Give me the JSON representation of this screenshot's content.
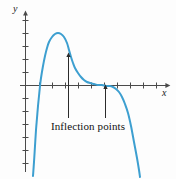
{
  "figure": {
    "background_color": "#fdfdfd",
    "width": 176,
    "height": 179
  },
  "axes": {
    "y_label": "y",
    "x_label": "x",
    "origin": {
      "x": 25,
      "y": 85
    },
    "axis_color": "#4a4a4a",
    "x_axis_from": 20,
    "x_axis_to": 168,
    "y_axis_from": 14,
    "y_axis_to": 172,
    "x_tick_positions": [
      39,
      52,
      65,
      78,
      91,
      104,
      117,
      130,
      143,
      156
    ],
    "y_tick_positions": [
      20,
      33,
      46,
      59,
      72,
      98,
      111,
      124,
      137,
      150,
      163
    ],
    "tick_half_length": 3
  },
  "annotations": {
    "label": "Inflection points",
    "label_color": "#111111",
    "arrow_color": "#2b2b2b",
    "arrows": [
      {
        "name": "left-inflection-arrow",
        "x": 68,
        "tip_y": 56,
        "tail_y": 118
      },
      {
        "name": "right-inflection-arrow",
        "x": 105,
        "tip_y": 88,
        "tail_y": 118
      }
    ]
  },
  "chart_data": {
    "type": "line",
    "title": "",
    "subtitle": "",
    "xlabel": "x",
    "ylabel": "y",
    "grid": false,
    "legend": null,
    "legend_position": "none",
    "xlim": [
      -1.5,
      11
    ],
    "ylim": [
      -5.5,
      5.5
    ],
    "series": [
      {
        "name": "f(x)",
        "color": "#3d9fd0",
        "line_width": 2,
        "description": "Rises steeply from lower left, crosses x-axis, peaks, falls through a first inflection point, flattens to a horizontal plateau at a second inflection point near the x-axis, then plunges steeply downward.",
        "points_px": [
          [
            33,
            176
          ],
          [
            34,
            162
          ],
          [
            35,
            146
          ],
          [
            36,
            130
          ],
          [
            37,
            118
          ],
          [
            38,
            106
          ],
          [
            39,
            96
          ],
          [
            40,
            86
          ],
          [
            41,
            78
          ],
          [
            43,
            66
          ],
          [
            45,
            56
          ],
          [
            47,
            48
          ],
          [
            49,
            42
          ],
          [
            52,
            37
          ],
          [
            55,
            34
          ],
          [
            58,
            33
          ],
          [
            61,
            34
          ],
          [
            64,
            37
          ],
          [
            67,
            43
          ],
          [
            69,
            50
          ],
          [
            71,
            57
          ],
          [
            73,
            63
          ],
          [
            75,
            68
          ],
          [
            78,
            73
          ],
          [
            81,
            77
          ],
          [
            84,
            80
          ],
          [
            87,
            82
          ],
          [
            90,
            83
          ],
          [
            94,
            84
          ],
          [
            98,
            85
          ],
          [
            102,
            85
          ],
          [
            106,
            86
          ],
          [
            110,
            86
          ],
          [
            113,
            87
          ],
          [
            116,
            89
          ],
          [
            119,
            92
          ],
          [
            122,
            97
          ],
          [
            125,
            104
          ],
          [
            128,
            113
          ],
          [
            131,
            126
          ],
          [
            134,
            142
          ],
          [
            137,
            158
          ],
          [
            139,
            170
          ],
          [
            140,
            177
          ]
        ]
      }
    ],
    "annotations": [
      {
        "text": "Inflection points",
        "targets_px": [
          [
            68,
            56
          ],
          [
            105,
            86
          ]
        ],
        "label_px": [
          88,
          128
        ]
      }
    ]
  }
}
